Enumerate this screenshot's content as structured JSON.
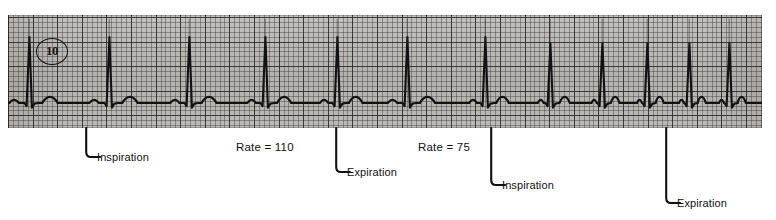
{
  "figure": {
    "kind": "ecg-rhythm-strip",
    "caption_number": "10"
  },
  "strip": {
    "lead_marker": "10",
    "paper_color": "#b9b7b4",
    "grid_bold_color": "#282422",
    "grid_fine_color": "#3c3734",
    "trace_color": "#121212",
    "baseline_y": 88,
    "small_box_px": 4.92,
    "large_box_px": 24.6
  },
  "annotations": [
    {
      "id": "inspiration-1",
      "label": "Inspiration",
      "x": 85,
      "drop": 30,
      "text_x": 97,
      "text_y": 151
    },
    {
      "id": "expiration-1",
      "label": "Expiration",
      "x": 335,
      "drop": 45,
      "text_x": 347,
      "text_y": 166
    },
    {
      "id": "inspiration-2",
      "label": "Inspiration",
      "x": 490,
      "drop": 58,
      "text_x": 502,
      "text_y": 179
    },
    {
      "id": "expiration-2",
      "label": "Expiration",
      "x": 665,
      "drop": 76,
      "text_x": 677,
      "text_y": 197
    }
  ],
  "rates": [
    {
      "id": "rate-110",
      "label": "Rate = 110",
      "value": 110,
      "x": 236,
      "y": 141
    },
    {
      "id": "rate-75",
      "label": "Rate  =  75",
      "value": 75,
      "x": 418,
      "y": 141
    }
  ],
  "chart_data": {
    "type": "line",
    "xlabel": "Time",
    "ylabel": "Amplitude (mV)",
    "grid": true,
    "legend": false,
    "paper_speed_mm_per_s": 25,
    "gain_mm_per_mV": 10,
    "ylim": [
      -0.5,
      2.2
    ],
    "annotations": [
      "Inspiration",
      "Rate = 110",
      "Expiration",
      "Rate = 75",
      "Inspiration",
      "Expiration"
    ],
    "series": [
      {
        "name": "ECG lead 10",
        "comment": "R-wave peak x positions in strip pixels; spacing shortens on inspiration, lengthens on expiration",
        "r_peaks_px": [
          22,
          102,
          182,
          258,
          330,
          400,
          478,
          543,
          595,
          640,
          682,
          722
        ],
        "rr_intervals_px": [
          80,
          80,
          76,
          72,
          70,
          78,
          65,
          52,
          45,
          42,
          40
        ],
        "rate_during_inspiration_bpm": 110,
        "rate_during_expiration_bpm": 75
      }
    ]
  }
}
